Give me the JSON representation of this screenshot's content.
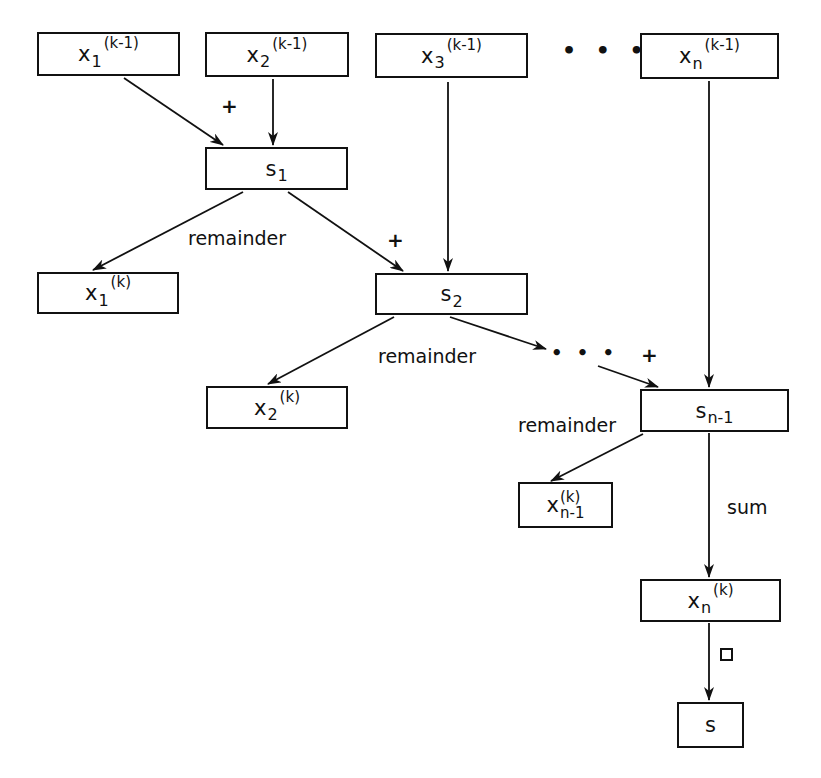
{
  "diagram": {
    "title": "",
    "inputs": [
      {
        "id": "x1",
        "base": "x",
        "sub": "1",
        "sup": "(k-1)"
      },
      {
        "id": "x2",
        "base": "x",
        "sub": "2",
        "sup": "(k-1)"
      },
      {
        "id": "x3",
        "base": "x",
        "sub": "3",
        "sup": "(k-1)"
      },
      {
        "id": "xn",
        "base": "x",
        "sub": "n",
        "sup": "(k-1)"
      }
    ],
    "ellipsis": "• • •",
    "sums": [
      {
        "id": "s1",
        "base": "s",
        "sub": "1"
      },
      {
        "id": "s2",
        "base": "s",
        "sub": "2"
      },
      {
        "id": "sn1",
        "base": "s",
        "sub": "n-1"
      }
    ],
    "outputs": [
      {
        "id": "x1k",
        "base": "x",
        "sub": "1",
        "sup": "(k)"
      },
      {
        "id": "x2k",
        "base": "x",
        "sub": "2",
        "sup": "(k)"
      },
      {
        "id": "xn1k",
        "base": "x",
        "sub": "n-1",
        "sup": "(k)"
      },
      {
        "id": "xnk",
        "base": "x",
        "sub": "n",
        "sup": "(k)"
      }
    ],
    "final": {
      "id": "s",
      "label": "s"
    },
    "edge_labels": {
      "plus": "+",
      "remainder": "remainder",
      "sum": "sum",
      "middle_dots": "• • •"
    },
    "edges": [
      {
        "from": "x1",
        "to": "s1",
        "label": "+"
      },
      {
        "from": "x2",
        "to": "s1"
      },
      {
        "from": "s1",
        "to": "x1k",
        "label": "remainder"
      },
      {
        "from": "s1",
        "to": "s2",
        "label": "+"
      },
      {
        "from": "x3",
        "to": "s2"
      },
      {
        "from": "s2",
        "to": "x2k",
        "label": "remainder"
      },
      {
        "from": "s2",
        "to": "sn1",
        "label": "+",
        "via": "..."
      },
      {
        "from": "xn",
        "to": "sn1"
      },
      {
        "from": "sn1",
        "to": "xn1k",
        "label": "remainder"
      },
      {
        "from": "sn1",
        "to": "xnk",
        "label": "sum"
      },
      {
        "from": "xnk",
        "to": "s",
        "label": "□"
      }
    ]
  }
}
